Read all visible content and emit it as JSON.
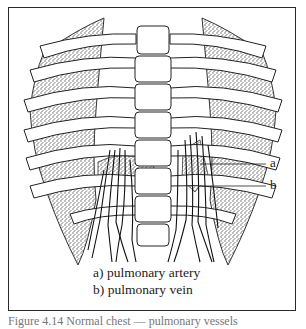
{
  "figure": {
    "labels": {
      "a": "a",
      "b": "b"
    },
    "legend": [
      {
        "key": "a)",
        "text": "pulmonary artery"
      },
      {
        "key": "b)",
        "text": "pulmonary vein"
      }
    ],
    "caption": "Figure 4.14  Normal chest — pulmonary vessels",
    "colors": {
      "line": "#222222",
      "stipple": "#9a9a9a",
      "background": "#ffffff"
    }
  }
}
